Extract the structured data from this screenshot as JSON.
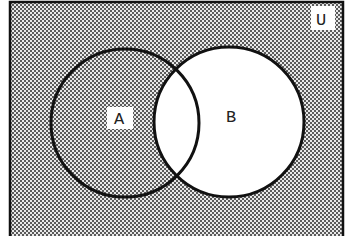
{
  "diagram": {
    "type": "venn",
    "universe_label": "U",
    "sets": [
      {
        "label": "A",
        "shaded": true
      },
      {
        "label": "B",
        "shaded": false
      }
    ],
    "intersection_shaded": false,
    "outside_shaded": true,
    "shaded_region": "complement of B",
    "colors": {
      "stroke": "#111111",
      "shade_dot": "#555555",
      "shade_bg": "#e6e6e6",
      "unshaded": "#ffffff"
    }
  }
}
